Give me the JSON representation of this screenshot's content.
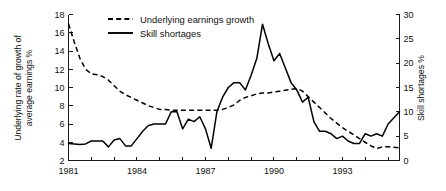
{
  "chart_data": {
    "type": "line",
    "title": "",
    "xlabel": "",
    "ylabel": "Underlying rate of growth of average earnings %",
    "y2label": "Skill shortages %",
    "grid": false,
    "legend_position": "top-center",
    "xlim": [
      1981,
      1995.5
    ],
    "ylim": [
      2,
      18
    ],
    "y2lim": [
      0,
      30
    ],
    "x_tick_labels": [
      "1981",
      "1984",
      "1987",
      "1990",
      "1993"
    ],
    "x_tick_values": [
      1981,
      1984,
      1987,
      1990,
      1993
    ],
    "x_minor_ticks": [
      1982,
      1983,
      1985,
      1986,
      1988,
      1989,
      1991,
      1992,
      1994,
      1995
    ],
    "y_tick_labels": [
      "2",
      "4",
      "6",
      "8",
      "10",
      "12",
      "14",
      "16",
      "18"
    ],
    "y_tick_values": [
      2,
      4,
      6,
      8,
      10,
      12,
      14,
      16,
      18
    ],
    "y2_tick_labels": [
      "0",
      "5",
      "10",
      "15",
      "20",
      "25",
      "30"
    ],
    "y2_tick_values": [
      0,
      5,
      10,
      15,
      20,
      25,
      30
    ],
    "series": [
      {
        "name": "Underlying earnings growth",
        "style": "dashed",
        "axis": "left",
        "units": "%",
        "x": [
          1981.0,
          1981.25,
          1981.5,
          1981.75,
          1982.0,
          1982.25,
          1982.5,
          1982.75,
          1983.0,
          1983.25,
          1983.5,
          1983.75,
          1984.0,
          1984.25,
          1984.5,
          1984.75,
          1985.0,
          1985.25,
          1985.5,
          1985.75,
          1986.0,
          1986.25,
          1986.5,
          1986.75,
          1987.0,
          1987.25,
          1987.5,
          1987.75,
          1988.0,
          1988.25,
          1988.5,
          1988.75,
          1989.0,
          1989.25,
          1989.5,
          1989.75,
          1990.0,
          1990.25,
          1990.5,
          1990.75,
          1991.0,
          1991.25,
          1991.5,
          1991.75,
          1992.0,
          1992.25,
          1992.5,
          1992.75,
          1993.0,
          1993.25,
          1993.5,
          1993.75,
          1994.0,
          1994.25,
          1994.5,
          1994.75,
          1995.0,
          1995.5
        ],
        "values": [
          17.0,
          15.0,
          13.2,
          12.0,
          11.5,
          11.4,
          11.2,
          10.8,
          10.2,
          9.6,
          9.2,
          8.9,
          8.6,
          8.3,
          8.0,
          7.8,
          7.6,
          7.6,
          7.5,
          7.5,
          7.5,
          7.5,
          7.5,
          7.5,
          7.5,
          7.5,
          7.5,
          7.6,
          7.8,
          8.1,
          8.6,
          8.9,
          9.1,
          9.3,
          9.4,
          9.4,
          9.5,
          9.6,
          9.7,
          9.8,
          9.9,
          9.6,
          9.0,
          8.4,
          7.8,
          7.2,
          6.6,
          6.1,
          5.6,
          5.2,
          4.8,
          4.4,
          4.0,
          3.6,
          3.3,
          3.5,
          3.5,
          3.4
        ]
      },
      {
        "name": "Skill shortages",
        "style": "solid",
        "axis": "right",
        "units": "%",
        "x": [
          1981.0,
          1981.25,
          1981.5,
          1981.75,
          1982.0,
          1982.25,
          1982.5,
          1982.75,
          1983.0,
          1983.25,
          1983.5,
          1983.75,
          1984.0,
          1984.25,
          1984.5,
          1984.75,
          1985.0,
          1985.25,
          1985.5,
          1985.75,
          1986.0,
          1986.25,
          1986.5,
          1986.75,
          1987.0,
          1987.25,
          1987.5,
          1987.75,
          1988.0,
          1988.25,
          1988.5,
          1988.75,
          1989.0,
          1989.25,
          1989.5,
          1989.75,
          1990.0,
          1990.25,
          1990.5,
          1990.75,
          1991.0,
          1991.25,
          1991.5,
          1991.75,
          1992.0,
          1992.25,
          1992.5,
          1992.75,
          1993.0,
          1993.25,
          1993.5,
          1993.75,
          1994.0,
          1994.25,
          1994.5,
          1994.75,
          1995.0,
          1995.5
        ],
        "values": [
          3.5,
          3.4,
          3.3,
          3.4,
          4.0,
          4.0,
          4.0,
          2.8,
          4.2,
          4.5,
          3.0,
          3.0,
          4.5,
          6.0,
          7.2,
          7.5,
          7.5,
          7.5,
          10.0,
          10.0,
          6.5,
          8.5,
          8.0,
          9.0,
          6.5,
          2.5,
          10.0,
          13.0,
          15.0,
          16.0,
          16.0,
          14.5,
          17.5,
          21.0,
          28.0,
          24.0,
          20.5,
          22.0,
          19.0,
          16.0,
          14.5,
          12.0,
          13.0,
          8.0,
          6.0,
          6.0,
          5.5,
          4.5,
          5.0,
          4.0,
          3.5,
          3.5,
          5.5,
          5.0,
          5.5,
          5.0,
          7.5,
          10.0
        ]
      }
    ]
  },
  "legend": {
    "items": [
      {
        "label": "Underlying earnings growth",
        "style": "dashed"
      },
      {
        "label": "Skill shortages",
        "style": "solid"
      }
    ]
  }
}
